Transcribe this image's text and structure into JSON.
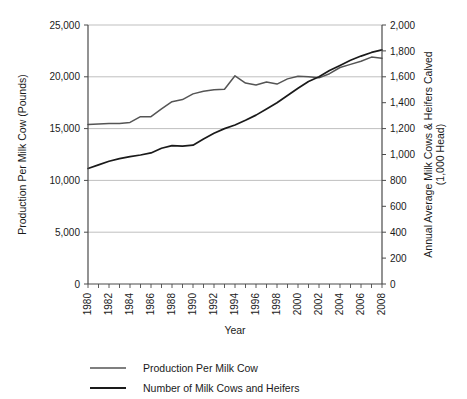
{
  "chart_data": {
    "type": "line",
    "title": "",
    "xlabel": "Year",
    "ylabel": "Production Per Milk Cow (Pounds)",
    "y2label": "Annual Average Milk Cows & Heifers Calved (1,000 Head)",
    "grid": true,
    "legend_position": "bottom-left",
    "xlim": [
      1980,
      2008
    ],
    "ylim": [
      0,
      25000
    ],
    "y2lim": [
      0,
      2000
    ],
    "x_tick_labels": [
      "1980",
      "1982",
      "1984",
      "1986",
      "1988",
      "1990",
      "1992",
      "1994",
      "1996",
      "1998",
      "2000",
      "2002",
      "2004",
      "2006",
      "2008"
    ],
    "x_tick_values": [
      1980,
      1982,
      1984,
      1986,
      1988,
      1990,
      1992,
      1994,
      1996,
      1998,
      2000,
      2002,
      2004,
      2006,
      2008
    ],
    "y_tick_labels": [
      "0",
      "5,000",
      "10,000",
      "15,000",
      "20,000",
      "25,000"
    ],
    "y_tick_values": [
      0,
      5000,
      10000,
      15000,
      20000,
      25000
    ],
    "y2_tick_labels": [
      "0",
      "200",
      "400",
      "600",
      "800",
      "1,000",
      "1,200",
      "1,400",
      "1,600",
      "1,800",
      "2,000"
    ],
    "y2_tick_values": [
      0,
      200,
      400,
      600,
      800,
      1000,
      1200,
      1400,
      1600,
      1800,
      2000
    ],
    "x": [
      1980,
      1981,
      1982,
      1983,
      1984,
      1985,
      1986,
      1987,
      1988,
      1989,
      1990,
      1991,
      1992,
      1993,
      1994,
      1995,
      1996,
      1997,
      1998,
      1999,
      2000,
      2001,
      2002,
      2003,
      2004,
      2005,
      2006,
      2007,
      2008
    ],
    "series": [
      {
        "name": "Production Per Milk Cow",
        "axis": "left",
        "units": "Pounds",
        "color": "#555555",
        "values": [
          15400,
          15450,
          15500,
          15500,
          15600,
          16150,
          16150,
          16900,
          17600,
          17800,
          18350,
          18600,
          18750,
          18800,
          20100,
          19400,
          19200,
          19500,
          19300,
          19800,
          20050,
          20000,
          19900,
          20300,
          20900,
          21200,
          21500,
          21900,
          21800
        ]
      },
      {
        "name": "Number of Milk Cows and Heifers",
        "axis": "right",
        "units": "1,000 Head",
        "color": "#1a1a1a",
        "values_left_scale": [
          11150,
          11500,
          11850,
          12100,
          12300,
          12450,
          12650,
          13100,
          13350,
          13300,
          13400,
          14000,
          14550,
          15000,
          15350,
          15800,
          16300,
          16900,
          17500,
          18200,
          18900,
          19550,
          20000,
          20600,
          21100,
          21600,
          22000,
          22350,
          22600
        ],
        "values": [
          892,
          920,
          948,
          968,
          984,
          996,
          1012,
          1048,
          1068,
          1064,
          1072,
          1120,
          1164,
          1200,
          1228,
          1264,
          1304,
          1352,
          1400,
          1456,
          1512,
          1564,
          1600,
          1648,
          1688,
          1728,
          1760,
          1788,
          1808
        ]
      }
    ]
  },
  "legend": {
    "items": [
      {
        "label": "Production Per Milk Cow"
      },
      {
        "label": "Number of Milk Cows and Heifers"
      }
    ]
  },
  "colors": {
    "production_line": "#555555",
    "cows_line": "#1a1a1a",
    "gridline": "#b8b8b8",
    "axis": "#4a4a4a",
    "background": "#ffffff"
  }
}
